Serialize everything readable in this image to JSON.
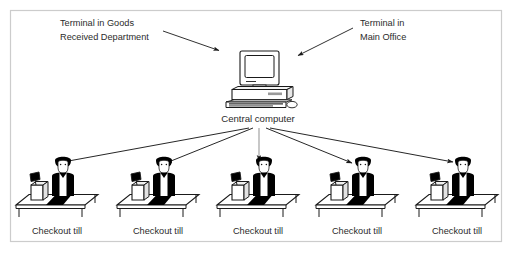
{
  "diagram": {
    "frame": {
      "border_color": "#cccccc",
      "background_color": "#ffffff"
    },
    "colors": {
      "line": "#1a1a1a",
      "text": "#2b2b2b",
      "fill_dark": "#000000",
      "fill_light": "#ffffff",
      "shade": "#d8d8d8",
      "border": "#cccccc"
    },
    "annotations": [
      {
        "id": "terminal-goods-received",
        "lines": [
          "Terminal in Goods",
          "Received Department"
        ],
        "x": 60,
        "y": 26
      },
      {
        "id": "terminal-main-office",
        "lines": [
          "Terminal in",
          "Main Office"
        ],
        "x": 360,
        "y": 26
      }
    ],
    "central": {
      "label": "Central computer",
      "x": 258,
      "y": 122
    },
    "tills": [
      {
        "id": "till-1",
        "label": "Checkout till",
        "cx": 57
      },
      {
        "id": "till-2",
        "label": "Checkout till",
        "cx": 158
      },
      {
        "id": "till-3",
        "label": "Checkout till",
        "cx": 258
      },
      {
        "id": "till-4",
        "label": "Checkout till",
        "cx": 357
      },
      {
        "id": "till-5",
        "label": "Checkout till",
        "cx": 457
      }
    ],
    "arrows": {
      "to_central_count": 2,
      "from_central_count": 5
    }
  }
}
